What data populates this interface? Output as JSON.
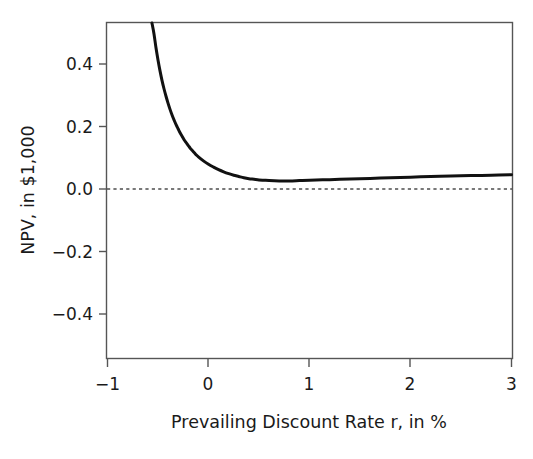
{
  "chart_data": {
    "type": "line",
    "title": "",
    "subtitle": "",
    "xlabel": "Prevailing Discount Rate r, in %",
    "ylabel": "NPV, in $1,000",
    "xlim": [
      -1,
      3
    ],
    "ylim": [
      -0.54,
      0.55
    ],
    "xticks": [
      -1,
      0,
      1,
      2,
      3
    ],
    "xticklabels": [
      "−1",
      "0",
      "1",
      "2",
      "3"
    ],
    "yticks": [
      0.4,
      0.2,
      0.0,
      -0.2,
      -0.4
    ],
    "yticklabels": [
      "0.4",
      "0.2",
      "0.0",
      "−0.2",
      "−0.4"
    ],
    "grid": false,
    "legend": null,
    "annotations": [
      {
        "name": "zero-reference-line",
        "kind": "horizontal-dashed-line",
        "y": 0.0,
        "style": "dotted",
        "color": "#4d4d4d"
      }
    ],
    "series": [
      {
        "name": "NPV",
        "color": "#111111",
        "linewidth": 3.0,
        "x": [
          -0.56,
          -0.54,
          -0.52,
          -0.5,
          -0.48,
          -0.46,
          -0.44,
          -0.42,
          -0.4,
          -0.38,
          -0.36,
          -0.34,
          -0.32,
          -0.3,
          -0.28,
          -0.26,
          -0.24,
          -0.22,
          -0.2,
          -0.18,
          -0.16,
          -0.14,
          -0.12,
          -0.1,
          -0.05,
          0.0,
          0.05,
          0.1,
          0.15,
          0.2,
          0.25,
          0.3,
          0.35,
          0.4,
          0.45,
          0.5,
          0.55,
          0.6,
          0.7,
          0.8,
          0.9,
          1.0,
          1.2,
          1.4,
          1.6,
          1.8,
          2.0,
          2.2,
          2.4,
          2.6,
          2.8,
          3.0
        ],
        "y": [
          0.55,
          0.497,
          0.452,
          0.413,
          0.378,
          0.347,
          0.32,
          0.296,
          0.274,
          0.254,
          0.236,
          0.22,
          0.205,
          0.192,
          0.179,
          0.168,
          0.157,
          0.148,
          0.139,
          0.13,
          0.123,
          0.116,
          0.109,
          0.103,
          0.09,
          0.079,
          0.07,
          0.062,
          0.055,
          0.049,
          0.044,
          0.04,
          0.036,
          0.033,
          0.031,
          0.029,
          0.028,
          0.027,
          0.026,
          0.026,
          0.027,
          0.028,
          0.03,
          0.032,
          0.034,
          0.036,
          0.038,
          0.04,
          0.042,
          0.043,
          0.044,
          0.046
        ]
      }
    ]
  },
  "figure": {
    "background_color": "#ffffff",
    "axes_color": "#555555",
    "text_color": "#1a1a1a"
  }
}
